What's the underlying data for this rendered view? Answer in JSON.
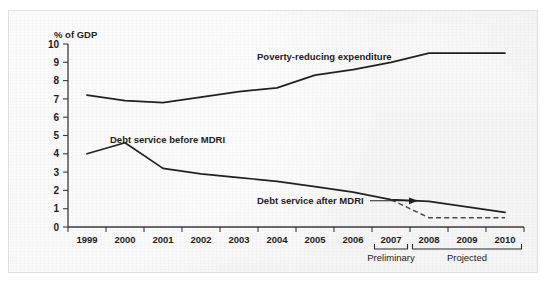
{
  "figure": {
    "cropped_caption_sliver": "·  ·   ·   ·  ·",
    "background_color": "#ececec",
    "ink_color": "#22211f"
  },
  "chart_data": {
    "type": "line",
    "title": "",
    "subtitle": "",
    "xlabel": "",
    "ylabel": "% of GDP",
    "ylim": [
      0,
      10
    ],
    "ytick_labels": [
      "0",
      "1",
      "2",
      "3",
      "4",
      "5",
      "6",
      "7",
      "8",
      "9",
      "10"
    ],
    "ytick_values": [
      0,
      1,
      2,
      3,
      4,
      5,
      6,
      7,
      8,
      9,
      10
    ],
    "grid": false,
    "legend_position": "inline-annotations",
    "x": [
      1999,
      2000,
      2001,
      2002,
      2003,
      2004,
      2005,
      2006,
      2007,
      2008,
      2009,
      2010
    ],
    "categories": [
      "1999",
      "2000",
      "2001",
      "2002",
      "2003",
      "2004",
      "2005",
      "2006",
      "2007",
      "2008",
      "2009",
      "2010"
    ],
    "series": [
      {
        "name": "Poverty-reducing expenditure",
        "style": "solid",
        "values": [
          7.2,
          6.9,
          6.8,
          7.1,
          7.4,
          7.6,
          8.3,
          8.6,
          9.0,
          9.5,
          9.5,
          9.5
        ]
      },
      {
        "name": "Debt service before MDRI",
        "style": "solid",
        "values": [
          4.0,
          4.6,
          3.2,
          2.9,
          2.7,
          2.5,
          2.2,
          1.9,
          1.5,
          1.4,
          1.1,
          0.8
        ]
      },
      {
        "name": "Debt service after MDRI",
        "style": "dashed",
        "values": [
          null,
          null,
          null,
          null,
          null,
          null,
          null,
          null,
          1.5,
          0.5,
          0.5,
          0.5
        ]
      }
    ],
    "annotations": [
      {
        "text": "Poverty-reducing expenditure",
        "target_series": "Poverty-reducing expenditure"
      },
      {
        "text": "Debt service before MDRI",
        "target_series": "Debt service before MDRI"
      },
      {
        "text": "Debt service after MDRI",
        "target_series": "Debt service after MDRI",
        "has_arrow": true
      }
    ],
    "period_brackets": [
      {
        "label": "Preliminary",
        "from": 2007,
        "to": 2007
      },
      {
        "label": "Projected",
        "from": 2008,
        "to": 2010
      }
    ]
  }
}
